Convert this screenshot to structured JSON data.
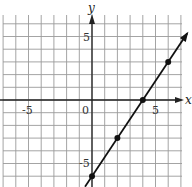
{
  "chart_data": {
    "type": "line",
    "title": "",
    "xlabel": "x",
    "ylabel": "y",
    "xlim": [
      -7,
      7
    ],
    "ylim": [
      -6.8,
      7
    ],
    "grid": true,
    "grid_step": 1,
    "x_ticks_labeled": [
      -5,
      0,
      5
    ],
    "y_ticks_labeled": [
      5,
      -5
    ],
    "tick_labels": {
      "x_neg": "-5",
      "origin": "0",
      "x_pos": "5",
      "y_pos": "5",
      "y_neg": "-5"
    },
    "series": [
      {
        "name": "line",
        "equation": "y = 1.5x - 6",
        "slope": 1.5,
        "intercept": -6,
        "arrow_end": true,
        "points": [
          {
            "x": 0,
            "y": -6
          },
          {
            "x": 2,
            "y": -3
          },
          {
            "x": 4,
            "y": 0
          },
          {
            "x": 6,
            "y": 3
          }
        ]
      }
    ]
  },
  "labels": {
    "x_axis": "x",
    "y_axis": "y",
    "x_neg": "-5",
    "origin": "0",
    "x_pos": "5",
    "y_pos": "5",
    "y_neg": "-5"
  }
}
